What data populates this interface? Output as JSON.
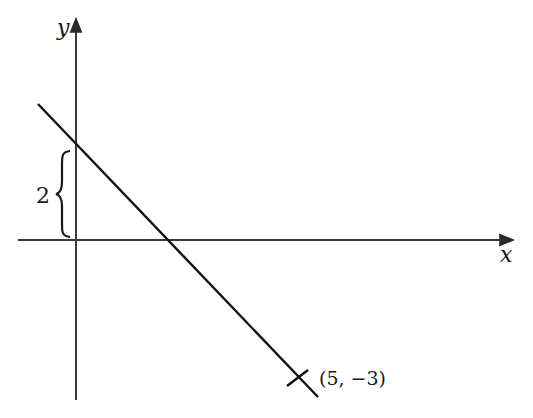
{
  "diagram": {
    "type": "coordinate-line-graph",
    "axes": {
      "x_label": "x",
      "y_label": "y"
    },
    "brace_label": "2",
    "point_label": "(5, −3)",
    "line": {
      "y_intercept": 2,
      "passes_through": [
        5,
        -3
      ],
      "slope": -1
    },
    "colors": {
      "axis": "#3a3a3a",
      "line": "#111111",
      "text": "#1a1a1a"
    }
  }
}
